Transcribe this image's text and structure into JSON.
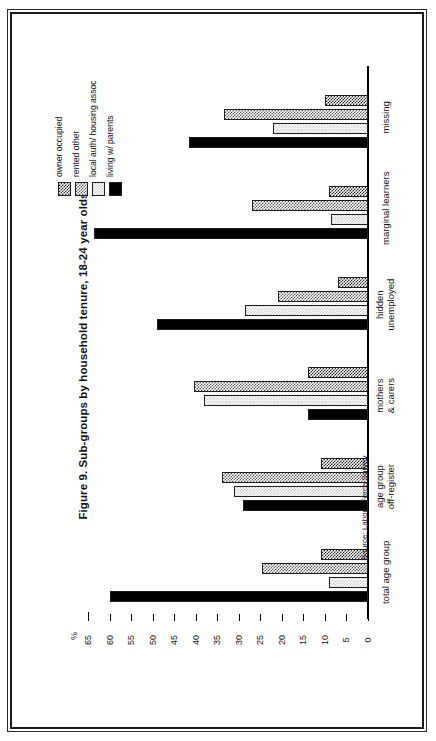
{
  "figure": {
    "title": "Figure 9. Sub-groups by household tenure, 18-24 year olds",
    "source": "Source: Labour Force Survey",
    "axis_unit": "%"
  },
  "legend": {
    "items": [
      {
        "label": "owner occupied",
        "swatch": "dark-checker-swatch"
      },
      {
        "label": "rented other",
        "swatch": "medium-checker-swatch"
      },
      {
        "label": "local auth/ housing assoc",
        "swatch": "light-checker-swatch"
      },
      {
        "label": "living w/ parents",
        "swatch": "solid-black-swatch"
      }
    ]
  },
  "chart_data": {
    "type": "bar",
    "orientation": "horizontal",
    "title": "Figure 9. Sub-groups by household tenure, 18-24 year olds",
    "xlabel": "",
    "ylabel": "%",
    "ylim": [
      0,
      65
    ],
    "yticks": [
      0,
      5,
      10,
      15,
      20,
      25,
      30,
      35,
      40,
      45,
      50,
      55,
      60,
      65
    ],
    "ytick_labels": [
      "0",
      "5",
      "10",
      "15",
      "20",
      "25",
      "30",
      "35",
      "40",
      "45",
      "50",
      "55",
      "60",
      "65"
    ],
    "grid": false,
    "legend_position": "top-left",
    "categories": [
      "total age group",
      "age group off-register",
      "mothers & carers",
      "hidden unemployed",
      "marginal learners",
      "missing"
    ],
    "category_lines": [
      [
        "total age group"
      ],
      [
        "age group",
        "off-register"
      ],
      [
        "mothers",
        "& carers"
      ],
      [
        "hidden",
        "unemployed"
      ],
      [
        "marginal learners"
      ],
      [
        "missing"
      ]
    ],
    "series": [
      {
        "name": "owner occupied",
        "values": [
          11,
          11,
          14,
          7,
          9,
          10
        ]
      },
      {
        "name": "rented other",
        "values": [
          24.5,
          34,
          40.5,
          21,
          27,
          33.5
        ]
      },
      {
        "name": "local auth/ housing assoc",
        "values": [
          9,
          31,
          38,
          28.5,
          8.5,
          22
        ]
      },
      {
        "name": "living w/ parents",
        "values": [
          60,
          29,
          14,
          49,
          63.5,
          41.5
        ]
      }
    ]
  }
}
